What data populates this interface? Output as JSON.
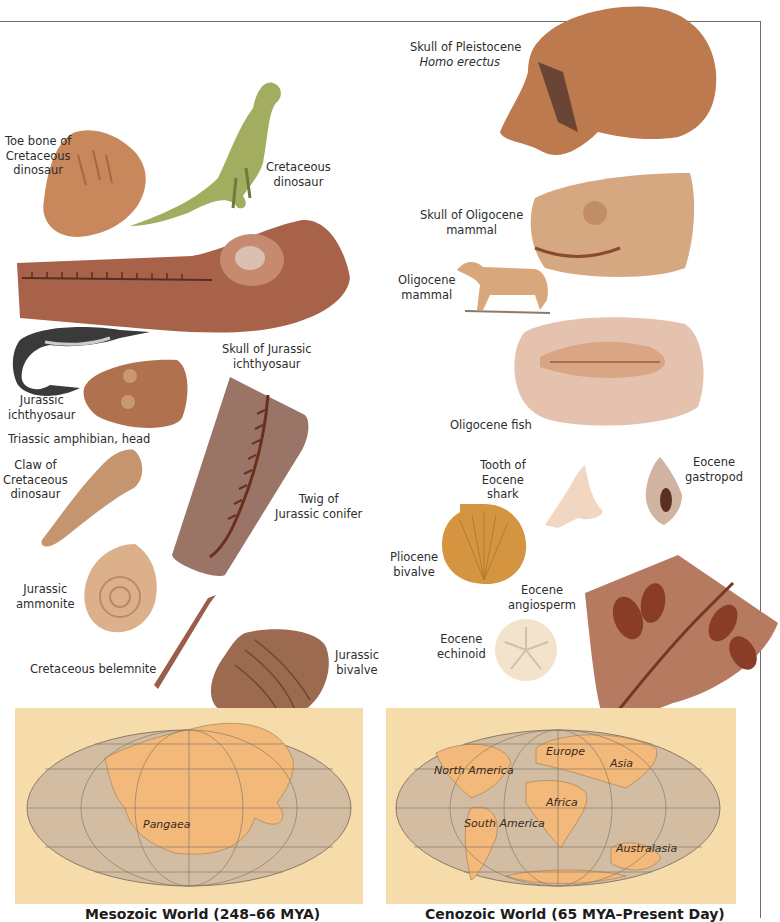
{
  "page": {
    "background": "#ffffff",
    "frame_color": "#6e6e6e"
  },
  "mesozoic": {
    "labels": {
      "toe_bone": [
        "Toe bone of",
        "Cretaceous",
        "dinosaur"
      ],
      "cretaceous_dinosaur": [
        "Cretaceous",
        "dinosaur"
      ],
      "ichthyosaur_skull": [
        "Skull of Jurassic",
        "ichthyosaur"
      ],
      "jurassic_ichthyosaur": [
        "Jurassic",
        "ichthyosaur"
      ],
      "triassic_amphibian": "Triassic amphibian, head",
      "claw": [
        "Claw of",
        "Cretaceous",
        "dinosaur"
      ],
      "conifer": [
        "Twig of",
        "Jurassic conifer"
      ],
      "ammonite": [
        "Jurassic",
        "ammonite"
      ],
      "belemnite": "Cretaceous belemnite",
      "jurassic_bivalve": [
        "Jurassic",
        "bivalve"
      ]
    },
    "map": {
      "label": "Pangaea",
      "caption": "Mesozoic World (248–66 MYA)"
    }
  },
  "cenozoic": {
    "labels": {
      "homo_erectus": [
        "Skull of Pleistocene",
        "Homo erectus"
      ],
      "oligocene_skull": [
        "Skull of Oligocene",
        "mammal"
      ],
      "oligocene_mammal": [
        "Oligocene",
        "mammal"
      ],
      "oligocene_fish": "Oligocene fish",
      "shark_tooth": [
        "Tooth of",
        "Eocene",
        "shark"
      ],
      "gastropod": [
        "Eocene",
        "gastropod"
      ],
      "pliocene_bivalve": [
        "Pliocene",
        "bivalve"
      ],
      "angiosperm": [
        "Eocene",
        "angiosperm"
      ],
      "echinoid": [
        "Eocene",
        "echinoid"
      ]
    },
    "map": {
      "labels": [
        "North America",
        "Europe",
        "Asia",
        "Africa",
        "South America",
        "Australasia"
      ],
      "caption": "Cenozoic World (65 MYA–Present Day)"
    }
  },
  "colors": {
    "map_paper": "#f6dcaa",
    "map_ocean": "#cdb9a0",
    "map_land": "#f2b574",
    "fossil_brown": "#b87a55",
    "fossil_dark": "#7e4a34",
    "dinosaur_green": "#9aa85a"
  }
}
